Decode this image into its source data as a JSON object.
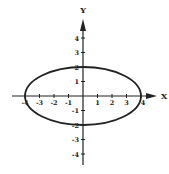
{
  "chart_data": {
    "type": "line",
    "title": "",
    "xlabel": "X",
    "ylabel": "Y",
    "xlim": [
      -4.5,
      5
    ],
    "ylim": [
      -4.5,
      5
    ],
    "grid": false,
    "x_ticks": [
      -4,
      -3,
      -2,
      -1,
      1,
      2,
      3,
      4
    ],
    "y_ticks": [
      4,
      3,
      2,
      1,
      -1,
      -2,
      -3,
      -4
    ],
    "series": [
      {
        "name": "ellipse",
        "equation": "x^2/16 + y^2/4 = 1",
        "center": [
          0,
          0
        ],
        "semi_major_x": 4,
        "semi_minor_y": 2
      }
    ]
  },
  "axes": {
    "x_label": "X",
    "y_label": "Y",
    "x_tick_labels": [
      "-4",
      "-3",
      "-2",
      "-1",
      "1",
      "2",
      "3",
      "4"
    ],
    "y_tick_labels": [
      "4",
      "3",
      "2",
      "1",
      "-1",
      "-2",
      "-3",
      "-4"
    ]
  },
  "colors": {
    "stroke": "#222222",
    "background": "#ffffff"
  }
}
